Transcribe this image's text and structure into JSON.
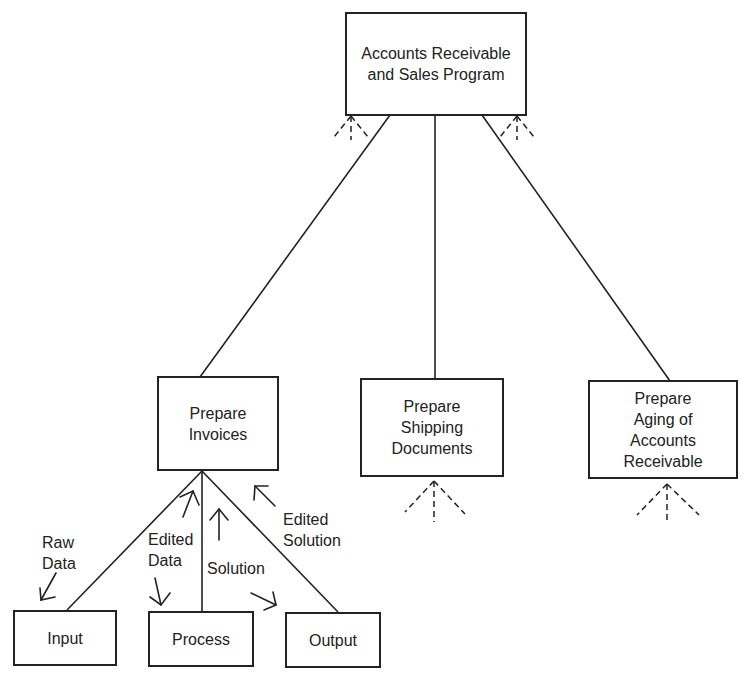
{
  "diagram": {
    "type": "hierarchy-chart",
    "root": {
      "id": "root",
      "label": "Accounts Receivable\nand Sales Program"
    },
    "level2": [
      {
        "id": "invoices",
        "label": "Prepare\nInvoices"
      },
      {
        "id": "shipping",
        "label": "Prepare\nShipping\nDocuments"
      },
      {
        "id": "aging",
        "label": "Prepare\nAging of\nAccounts\nReceivable"
      }
    ],
    "level3": [
      {
        "id": "input",
        "label": "Input"
      },
      {
        "id": "process",
        "label": "Process"
      },
      {
        "id": "output",
        "label": "Output"
      }
    ],
    "flow_labels": {
      "raw_data": "Raw\nData",
      "edited_data": "Edited\nData",
      "solution": "Solution",
      "edited_solution": "Edited\nSolution"
    },
    "edges": [
      {
        "from": "root",
        "to": "invoices"
      },
      {
        "from": "root",
        "to": "shipping"
      },
      {
        "from": "root",
        "to": "aging"
      },
      {
        "from": "invoices",
        "to": "input"
      },
      {
        "from": "invoices",
        "to": "process"
      },
      {
        "from": "invoices",
        "to": "output"
      }
    ],
    "line_color": "#222222"
  }
}
